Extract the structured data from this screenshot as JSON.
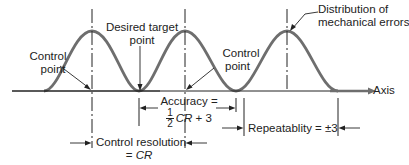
{
  "labels": {
    "control_point_left": [
      "Control",
      "point"
    ],
    "desired_target": [
      "Desired target",
      "point"
    ],
    "control_point_right": [
      "Control",
      "point"
    ],
    "distribution": [
      "Distribution of",
      "mechanical errors"
    ],
    "axis": "Axis",
    "accuracy_title": "Accuracy =",
    "accuracy_num": "1",
    "accuracy_den": "2",
    "accuracy_cr": "CR",
    "accuracy_rest": " + 3",
    "control_resolution": "Control resolution",
    "control_resolution_eq": "= ",
    "control_resolution_cr": "CR",
    "repeatability": "Repeatablity = ±3"
  },
  "colors": {
    "curve": "#6e6e6e",
    "line": "#222222"
  }
}
